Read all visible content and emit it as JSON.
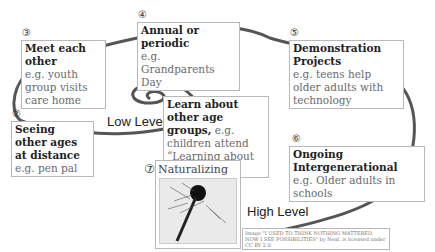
{
  "diagram": {
    "levels": {
      "low": "Low Level",
      "high": "High Level"
    },
    "steps": [
      {
        "num": "①",
        "title": "Learn about other age groups,",
        "example": " e.g. children attend “Learning about Aging”"
      },
      {
        "num": "②",
        "title": "Seeing other ages at distance",
        "example": " e.g. pen pal"
      },
      {
        "num": "③",
        "title": "Meet each other",
        "example": "e.g. youth group visits care home"
      },
      {
        "num": "④",
        "title": "Annual or periodic",
        "example": "e.g. Grandparents Day"
      },
      {
        "num": "⑤",
        "title": "Demonstration Projects",
        "example": "e.g. teens help older adults with technology"
      },
      {
        "num": "⑥",
        "title": "Ongoing Intergenerational",
        "example": "e.g. Older adults in schools"
      },
      {
        "num": "⑦",
        "title": "Naturalizing IG",
        "example": ""
      }
    ],
    "credit": "Image \"I USED TO THINK NOTHING MATTERED. NOW I SEE POSSIBILITIES\" by Neal. is licensed under CC BY 2.0.",
    "colors": {
      "spiral": "#555555",
      "box_border": "#b8b8b8"
    }
  }
}
